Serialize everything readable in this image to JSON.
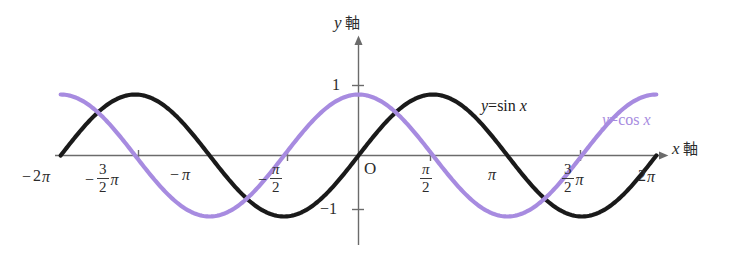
{
  "figure": {
    "background_color": "#ffffff",
    "axis_color": "#6b6b6b"
  },
  "axes": {
    "x_axis": {
      "name_var": "x",
      "name_kanji": "軸",
      "arrow": "right"
    },
    "y_axis": {
      "name_var": "y",
      "name_kanji": "軸",
      "arrow": "up"
    }
  },
  "origin": {
    "label": "O"
  },
  "x_ticks": [
    {
      "label_minus": "−",
      "label_main": "2",
      "label_pi": "π",
      "kind": "plain",
      "value": -6.2832
    },
    {
      "label_minus": "−",
      "num": "3",
      "den": "2",
      "label_pi": "π",
      "kind": "fraction",
      "value": -4.7124
    },
    {
      "label_minus": "−",
      "label_main": "",
      "label_pi": "π",
      "kind": "plain",
      "value": -3.1416
    },
    {
      "label_minus": "−",
      "num": "π",
      "den": "2",
      "label_pi": "",
      "kind": "fraction-pi",
      "value": -1.5708
    },
    {
      "label_minus": "",
      "num": "π",
      "den": "2",
      "label_pi": "",
      "kind": "fraction-pi",
      "value": 1.5708
    },
    {
      "label_minus": "",
      "label_main": "",
      "label_pi": "π",
      "kind": "plain",
      "value": 3.1416
    },
    {
      "label_minus": "",
      "num": "3",
      "den": "2",
      "label_pi": "π",
      "kind": "fraction",
      "value": 4.7124
    },
    {
      "label_minus": "",
      "label_main": "2",
      "label_pi": "π",
      "kind": "plain",
      "value": 6.2832
    }
  ],
  "y_ticks": [
    {
      "label": "1",
      "value": 1
    },
    {
      "label": "−1",
      "value": -1
    }
  ],
  "curves": [
    {
      "name": "sine",
      "label_y": "y",
      "label_eq": "=",
      "label_fn": "sin",
      "label_var": "x",
      "color": "#1a1a1a",
      "stroke_width": 4.2
    },
    {
      "name": "cosine",
      "label_y": "y",
      "label_eq": "=",
      "label_fn": "cos",
      "label_var": "x",
      "color": "#a78be0",
      "stroke_width": 4.2
    }
  ],
  "chart_data": {
    "type": "line",
    "title": "",
    "xlabel": "x 軸",
    "ylabel": "y 軸",
    "xlim": [
      -6.2832,
      6.2832
    ],
    "ylim": [
      -1.35,
      1.35
    ],
    "grid": false,
    "legend": "inline-annotation",
    "x_tick_values": [
      -6.2832,
      -4.7124,
      -3.1416,
      -1.5708,
      1.5708,
      3.1416,
      4.7124,
      6.2832
    ],
    "x_tick_labels": [
      "−2π",
      "−(3/2)π",
      "−π",
      "−π/2",
      "π/2",
      "π",
      "(3/2)π",
      "2π"
    ],
    "y_tick_values": [
      1,
      -1
    ],
    "y_tick_labels": [
      "1",
      "−1"
    ],
    "series": [
      {
        "name": "y=sin x",
        "color": "#1a1a1a",
        "formula": "sin(x)",
        "x": [
          -6.2832,
          -5.4978,
          -4.7124,
          -3.927,
          -3.1416,
          -2.3562,
          -1.5708,
          -0.7854,
          0,
          0.7854,
          1.5708,
          2.3562,
          3.1416,
          3.927,
          4.7124,
          5.4978,
          6.2832
        ],
        "values": [
          0,
          0.7071,
          1,
          0.7071,
          0,
          -0.7071,
          -1,
          -0.7071,
          0,
          0.7071,
          1,
          0.7071,
          0,
          -0.7071,
          -1,
          -0.7071,
          0
        ]
      },
      {
        "name": "y=cos x",
        "color": "#a78be0",
        "formula": "cos(x)",
        "x": [
          -6.2832,
          -5.4978,
          -4.7124,
          -3.927,
          -3.1416,
          -2.3562,
          -1.5708,
          -0.7854,
          0,
          0.7854,
          1.5708,
          2.3562,
          3.1416,
          3.927,
          4.7124,
          5.4978,
          6.2832
        ],
        "values": [
          1,
          0.7071,
          0,
          -0.7071,
          -1,
          -0.7071,
          0,
          0.7071,
          1,
          0.7071,
          0,
          -0.7071,
          -1,
          -0.7071,
          0,
          0.7071,
          1
        ]
      }
    ]
  }
}
